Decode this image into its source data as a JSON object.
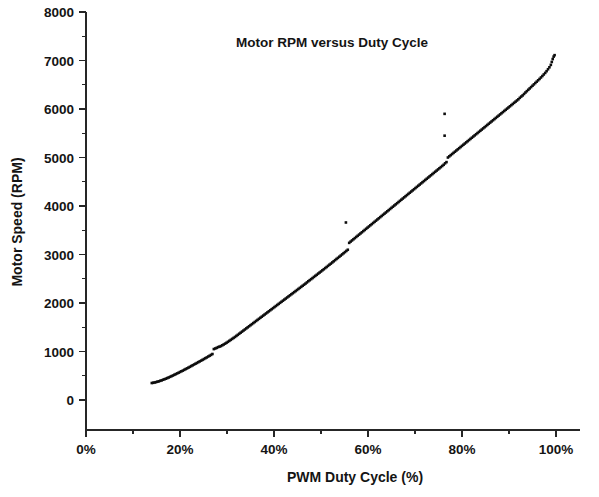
{
  "chart_data": {
    "type": "scatter",
    "title": "Motor RPM versus Duty Cycle",
    "xlabel": "PWM Duty Cycle (%)",
    "ylabel": "Motor Speed (RPM)",
    "xlim": [
      0,
      100
    ],
    "ylim": [
      0,
      8000
    ],
    "grid": false,
    "legend": "none",
    "marker_color": "#0d0d0d",
    "x_tick_labels": [
      "0%",
      "20%",
      "40%",
      "60%",
      "80%",
      "100%"
    ],
    "x_tick_values": [
      0,
      20,
      40,
      60,
      80,
      100
    ],
    "x_minor_tick_values": [
      10,
      30,
      50,
      70,
      90
    ],
    "y_tick_labels": [
      "0",
      "1000",
      "2000",
      "3000",
      "4000",
      "5000",
      "6000",
      "7000",
      "8000"
    ],
    "y_tick_values": [
      0,
      1000,
      2000,
      3000,
      4000,
      5000,
      6000,
      7000,
      8000
    ],
    "y_minor_tick_values": [
      500,
      1500,
      2500,
      3500,
      4500,
      5500,
      6500,
      7500
    ],
    "series": [
      {
        "name": "Motor speed samples",
        "points": [
          [
            14.0,
            350
          ],
          [
            14.3,
            355
          ],
          [
            14.6,
            362
          ],
          [
            14.9,
            368
          ],
          [
            15.2,
            378
          ],
          [
            15.5,
            385
          ],
          [
            15.8,
            396
          ],
          [
            16.1,
            405
          ],
          [
            16.4,
            418
          ],
          [
            16.7,
            428
          ],
          [
            17.0,
            440
          ],
          [
            17.3,
            452
          ],
          [
            17.6,
            465
          ],
          [
            17.9,
            478
          ],
          [
            18.2,
            492
          ],
          [
            18.5,
            505
          ],
          [
            18.8,
            520
          ],
          [
            19.1,
            534
          ],
          [
            19.4,
            548
          ],
          [
            19.7,
            562
          ],
          [
            20.0,
            578
          ],
          [
            20.3,
            592
          ],
          [
            20.6,
            606
          ],
          [
            20.9,
            622
          ],
          [
            21.2,
            638
          ],
          [
            21.5,
            652
          ],
          [
            21.8,
            668
          ],
          [
            22.1,
            684
          ],
          [
            22.4,
            700
          ],
          [
            22.7,
            716
          ],
          [
            23.0,
            732
          ],
          [
            23.3,
            748
          ],
          [
            23.6,
            764
          ],
          [
            23.9,
            780
          ],
          [
            24.2,
            796
          ],
          [
            24.5,
            812
          ],
          [
            24.8,
            828
          ],
          [
            25.1,
            845
          ],
          [
            25.4,
            862
          ],
          [
            25.7,
            878
          ],
          [
            26.0,
            896
          ],
          [
            26.3,
            912
          ],
          [
            26.6,
            930
          ],
          [
            26.9,
            948
          ],
          [
            27.2,
            1050
          ],
          [
            27.5,
            1062
          ],
          [
            27.8,
            1075
          ],
          [
            28.1,
            1090
          ],
          [
            28.4,
            1100
          ],
          [
            28.7,
            1112
          ],
          [
            29.0,
            1128
          ],
          [
            29.3,
            1145
          ],
          [
            29.6,
            1162
          ],
          [
            29.9,
            1180
          ],
          [
            30.2,
            1200
          ],
          [
            30.5,
            1220
          ],
          [
            30.8,
            1240
          ],
          [
            31.1,
            1260
          ],
          [
            31.4,
            1280
          ],
          [
            31.7,
            1300
          ],
          [
            32.0,
            1322
          ],
          [
            32.3,
            1344
          ],
          [
            32.6,
            1366
          ],
          [
            32.9,
            1388
          ],
          [
            33.2,
            1410
          ],
          [
            33.5,
            1432
          ],
          [
            33.8,
            1454
          ],
          [
            34.1,
            1476
          ],
          [
            34.4,
            1498
          ],
          [
            34.7,
            1520
          ],
          [
            35.0,
            1542
          ],
          [
            35.3,
            1564
          ],
          [
            35.6,
            1586
          ],
          [
            35.9,
            1608
          ],
          [
            36.2,
            1630
          ],
          [
            36.5,
            1652
          ],
          [
            36.8,
            1674
          ],
          [
            37.1,
            1696
          ],
          [
            37.4,
            1718
          ],
          [
            37.7,
            1740
          ],
          [
            38.0,
            1762
          ],
          [
            38.3,
            1784
          ],
          [
            38.6,
            1806
          ],
          [
            38.9,
            1828
          ],
          [
            39.2,
            1850
          ],
          [
            39.5,
            1872
          ],
          [
            39.8,
            1894
          ],
          [
            40.1,
            1916
          ],
          [
            40.4,
            1938
          ],
          [
            40.7,
            1960
          ],
          [
            41.0,
            1982
          ],
          [
            41.3,
            2004
          ],
          [
            41.6,
            2026
          ],
          [
            41.9,
            2048
          ],
          [
            42.2,
            2070
          ],
          [
            42.5,
            2092
          ],
          [
            42.8,
            2114
          ],
          [
            43.1,
            2136
          ],
          [
            43.4,
            2158
          ],
          [
            43.7,
            2180
          ],
          [
            44.0,
            2202
          ],
          [
            44.3,
            2224
          ],
          [
            44.6,
            2246
          ],
          [
            44.9,
            2268
          ],
          [
            45.2,
            2290
          ],
          [
            45.5,
            2312
          ],
          [
            45.8,
            2334
          ],
          [
            46.1,
            2356
          ],
          [
            46.4,
            2378
          ],
          [
            46.7,
            2400
          ],
          [
            47.0,
            2424
          ],
          [
            47.3,
            2448
          ],
          [
            47.6,
            2470
          ],
          [
            47.9,
            2492
          ],
          [
            48.2,
            2514
          ],
          [
            48.5,
            2538
          ],
          [
            48.8,
            2560
          ],
          [
            49.1,
            2582
          ],
          [
            49.4,
            2606
          ],
          [
            49.7,
            2628
          ],
          [
            50.0,
            2650
          ],
          [
            50.3,
            2674
          ],
          [
            50.6,
            2696
          ],
          [
            50.9,
            2720
          ],
          [
            51.2,
            2742
          ],
          [
            51.5,
            2766
          ],
          [
            51.8,
            2790
          ],
          [
            52.1,
            2812
          ],
          [
            52.4,
            2836
          ],
          [
            52.7,
            2860
          ],
          [
            53.0,
            2884
          ],
          [
            53.3,
            2908
          ],
          [
            53.6,
            2930
          ],
          [
            53.9,
            2954
          ],
          [
            54.2,
            2978
          ],
          [
            54.5,
            3002
          ],
          [
            54.8,
            3026
          ],
          [
            55.1,
            3050
          ],
          [
            55.4,
            3074
          ],
          [
            55.7,
            3098
          ],
          [
            56.0,
            3240
          ],
          [
            56.3,
            3266
          ],
          [
            56.6,
            3290
          ],
          [
            56.9,
            3314
          ],
          [
            57.2,
            3338
          ],
          [
            57.5,
            3362
          ],
          [
            57.8,
            3386
          ],
          [
            58.1,
            3410
          ],
          [
            58.4,
            3434
          ],
          [
            58.7,
            3458
          ],
          [
            59.0,
            3482
          ],
          [
            59.3,
            3506
          ],
          [
            59.6,
            3530
          ],
          [
            59.9,
            3554
          ],
          [
            60.2,
            3578
          ],
          [
            60.5,
            3602
          ],
          [
            60.8,
            3626
          ],
          [
            61.1,
            3650
          ],
          [
            61.4,
            3674
          ],
          [
            61.7,
            3698
          ],
          [
            62.0,
            3722
          ],
          [
            62.3,
            3746
          ],
          [
            62.6,
            3770
          ],
          [
            62.9,
            3794
          ],
          [
            63.2,
            3818
          ],
          [
            63.5,
            3842
          ],
          [
            63.8,
            3866
          ],
          [
            64.1,
            3890
          ],
          [
            64.4,
            3914
          ],
          [
            64.7,
            3938
          ],
          [
            65.0,
            3962
          ],
          [
            65.3,
            3986
          ],
          [
            65.6,
            4010
          ],
          [
            65.9,
            4034
          ],
          [
            66.2,
            4058
          ],
          [
            66.5,
            4082
          ],
          [
            66.8,
            4106
          ],
          [
            67.1,
            4130
          ],
          [
            67.4,
            4154
          ],
          [
            67.7,
            4178
          ],
          [
            68.0,
            4202
          ],
          [
            68.3,
            4226
          ],
          [
            68.6,
            4250
          ],
          [
            68.9,
            4274
          ],
          [
            69.2,
            4298
          ],
          [
            69.5,
            4322
          ],
          [
            69.8,
            4346
          ],
          [
            70.1,
            4370
          ],
          [
            70.4,
            4394
          ],
          [
            70.7,
            4418
          ],
          [
            71.0,
            4442
          ],
          [
            71.3,
            4466
          ],
          [
            71.6,
            4490
          ],
          [
            71.9,
            4514
          ],
          [
            72.2,
            4538
          ],
          [
            72.5,
            4562
          ],
          [
            72.8,
            4586
          ],
          [
            73.1,
            4610
          ],
          [
            73.4,
            4634
          ],
          [
            73.7,
            4658
          ],
          [
            74.0,
            4682
          ],
          [
            74.3,
            4706
          ],
          [
            74.6,
            4730
          ],
          [
            74.9,
            4754
          ],
          [
            75.2,
            4778
          ],
          [
            75.5,
            4802
          ],
          [
            75.8,
            4826
          ],
          [
            76.1,
            4850
          ],
          [
            76.4,
            4880
          ],
          [
            76.7,
            4905
          ],
          [
            77.0,
            5000
          ],
          [
            77.3,
            5024
          ],
          [
            77.6,
            5048
          ],
          [
            77.9,
            5072
          ],
          [
            78.2,
            5096
          ],
          [
            78.5,
            5120
          ],
          [
            78.8,
            5144
          ],
          [
            79.1,
            5168
          ],
          [
            79.4,
            5192
          ],
          [
            79.7,
            5216
          ],
          [
            80.0,
            5240
          ],
          [
            80.3,
            5264
          ],
          [
            80.6,
            5288
          ],
          [
            80.9,
            5312
          ],
          [
            81.2,
            5336
          ],
          [
            81.5,
            5360
          ],
          [
            81.8,
            5384
          ],
          [
            82.1,
            5408
          ],
          [
            82.4,
            5432
          ],
          [
            82.7,
            5456
          ],
          [
            83.0,
            5480
          ],
          [
            83.3,
            5504
          ],
          [
            83.6,
            5528
          ],
          [
            83.9,
            5552
          ],
          [
            84.2,
            5576
          ],
          [
            84.5,
            5600
          ],
          [
            84.8,
            5624
          ],
          [
            85.1,
            5648
          ],
          [
            85.4,
            5672
          ],
          [
            85.7,
            5696
          ],
          [
            86.0,
            5720
          ],
          [
            86.3,
            5744
          ],
          [
            86.6,
            5768
          ],
          [
            86.9,
            5792
          ],
          [
            87.2,
            5816
          ],
          [
            87.5,
            5840
          ],
          [
            87.8,
            5864
          ],
          [
            88.1,
            5888
          ],
          [
            88.4,
            5912
          ],
          [
            88.7,
            5936
          ],
          [
            89.0,
            5960
          ],
          [
            89.3,
            5984
          ],
          [
            89.6,
            6008
          ],
          [
            89.9,
            6032
          ],
          [
            90.2,
            6056
          ],
          [
            90.5,
            6080
          ],
          [
            90.8,
            6104
          ],
          [
            91.1,
            6128
          ],
          [
            91.4,
            6152
          ],
          [
            91.7,
            6176
          ],
          [
            92.0,
            6200
          ],
          [
            92.3,
            6230
          ],
          [
            92.6,
            6256
          ],
          [
            92.9,
            6280
          ],
          [
            93.2,
            6310
          ],
          [
            93.5,
            6340
          ],
          [
            93.8,
            6368
          ],
          [
            94.1,
            6396
          ],
          [
            94.4,
            6424
          ],
          [
            94.7,
            6452
          ],
          [
            95.0,
            6480
          ],
          [
            95.3,
            6508
          ],
          [
            95.6,
            6536
          ],
          [
            95.9,
            6564
          ],
          [
            96.2,
            6592
          ],
          [
            96.5,
            6620
          ],
          [
            96.8,
            6650
          ],
          [
            97.1,
            6680
          ],
          [
            97.4,
            6712
          ],
          [
            97.7,
            6744
          ],
          [
            98.0,
            6780
          ],
          [
            98.3,
            6820
          ],
          [
            98.6,
            6860
          ],
          [
            98.9,
            6910
          ],
          [
            99.1,
            6970
          ],
          [
            99.3,
            7030
          ],
          [
            99.5,
            7080
          ],
          [
            99.7,
            7110
          ]
        ]
      },
      {
        "name": "Outliers",
        "points": [
          [
            76.3,
            5900
          ],
          [
            76.3,
            5450
          ],
          [
            55.3,
            3660
          ]
        ]
      }
    ]
  }
}
